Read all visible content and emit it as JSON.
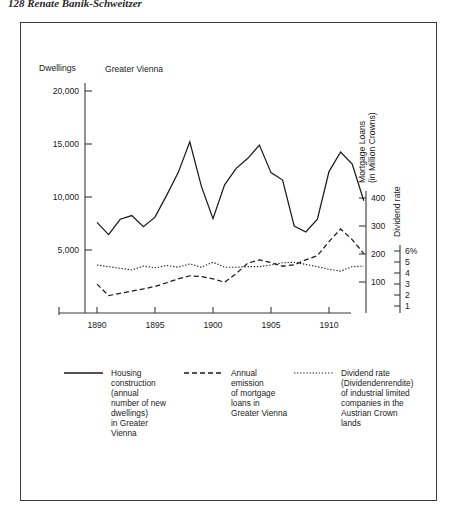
{
  "page": {
    "running_head": "128   Renate Banik-Schweitzer"
  },
  "figure": {
    "region_label": "Greater Vienna"
  },
  "chart_data": {
    "type": "line",
    "title": "",
    "subtitle": "Greater Vienna",
    "xlabel": "",
    "ylabel": "Dwellings",
    "x": [
      1890,
      1891,
      1892,
      1893,
      1894,
      1895,
      1896,
      1897,
      1898,
      1899,
      1900,
      1901,
      1902,
      1903,
      1904,
      1905,
      1906,
      1907,
      1908,
      1909,
      1910,
      1911,
      1912,
      1913
    ],
    "xlim": [
      1889,
      1913
    ],
    "xticks": [
      1890,
      1895,
      1900,
      1905,
      1910
    ],
    "xticklabels": [
      "1890",
      "1895",
      "1900",
      "1905",
      "1910"
    ],
    "grid": false,
    "legend_position": "below-plot",
    "axes": [
      {
        "id": "left",
        "title": "Dwellings",
        "ticks": [
          5000,
          10000,
          15000,
          20000
        ],
        "ticklabels": [
          "5,000",
          "10,000",
          "15,000",
          "20,000"
        ],
        "lim": [
          0,
          21000
        ],
        "position": "left"
      },
      {
        "id": "mortgage",
        "title": "Mortgage Loans (in Million Crowns)",
        "title_lines": [
          "Mortgage Loans",
          "(in Million Crowns)"
        ],
        "ticks": [
          100,
          200,
          300,
          400
        ],
        "ticklabels": [
          "100",
          "200",
          "300",
          "400"
        ],
        "lim": [
          0,
          430
        ],
        "position": "right"
      },
      {
        "id": "dividend",
        "title": "Dividend rate",
        "ticks": [
          1,
          2,
          3,
          4,
          5,
          6
        ],
        "ticklabels": [
          "1",
          "2",
          "3",
          "4",
          "5",
          "6%"
        ],
        "lim": [
          0,
          6.6
        ],
        "position": "right-outer"
      }
    ],
    "series": [
      {
        "name": "housing-construction",
        "axis": "left",
        "style": "solid",
        "legend_label": "Housing construction (annual number of new dwellings) in Greater Vienna",
        "legend_lines": [
          "Housing",
          "construction",
          "(annual",
          "number of new",
          "dwellings)",
          "in Greater",
          "Vienna"
        ],
        "values": [
          7600,
          6450,
          7900,
          8250,
          7200,
          8100,
          10150,
          12300,
          15200,
          11000,
          7950,
          11150,
          12700,
          13650,
          14900,
          12300,
          11600,
          7250,
          6700,
          7900,
          12400,
          14250,
          13100,
          9650
        ]
      },
      {
        "name": "mortgage-loans",
        "axis": "mortgage",
        "style": "dashed",
        "legend_label": "Annual emission of mortgage loans in Greater Vienna",
        "legend_lines": [
          "Annual",
          "emission",
          "of mortgage",
          "loans in",
          "Greater Vienna"
        ],
        "values": [
          103,
          62,
          70,
          78,
          86,
          95,
          108,
          122,
          133,
          130,
          122,
          110,
          141,
          178,
          190,
          180,
          167,
          172,
          190,
          205,
          255,
          300,
          262,
          212
        ]
      },
      {
        "name": "dividend-rate",
        "axis": "dividend",
        "style": "dotted",
        "legend_label": "Dividend rate (Dividendenrendite) of industrial limited companies in the Austrian Crown lands",
        "legend_lines": [
          "Dividend rate",
          "(Dividendenrendite)",
          "of industrial limited",
          "companies in the",
          "Austrian Crown",
          "lands"
        ],
        "values": [
          5.0,
          4.85,
          4.7,
          4.55,
          4.9,
          4.75,
          4.95,
          4.8,
          5.1,
          4.8,
          5.25,
          4.8,
          4.8,
          4.85,
          4.85,
          5.0,
          5.2,
          5.25,
          5.05,
          4.85,
          4.6,
          4.45,
          4.85,
          4.9
        ]
      }
    ]
  }
}
